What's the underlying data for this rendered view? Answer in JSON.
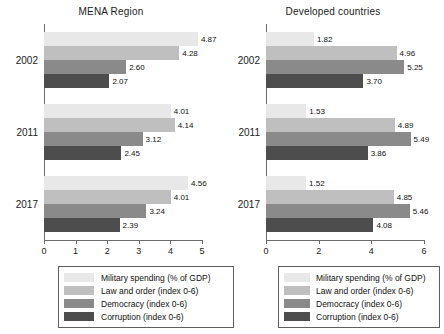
{
  "chart_data": {
    "type": "bar",
    "orientation": "horizontal",
    "title": "",
    "panels": [
      {
        "title": "MENA Region",
        "categories": [
          "2002",
          "2011",
          "2017"
        ],
        "xlabel": "",
        "ylabel": "",
        "xlim": [
          0,
          5
        ],
        "xticks": [
          "0",
          "1",
          "2",
          "3",
          "4",
          "5"
        ],
        "grid": false,
        "series": [
          {
            "name": "Military spending  (% of GDP)",
            "color": "#e8e8e8",
            "values": [
              4.87,
              4.01,
              4.56
            ]
          },
          {
            "name": "Law and order (index 0-6)",
            "color": "#bfbfbf",
            "values": [
              4.28,
              4.14,
              4.01
            ]
          },
          {
            "name": "Democracy (index 0-6)",
            "color": "#8a8a8a",
            "values": [
              2.6,
              3.12,
              3.24
            ]
          },
          {
            "name": "Corruption (index 0-6)",
            "color": "#4d4d4d",
            "values": [
              2.07,
              2.45,
              2.39
            ]
          }
        ],
        "data_labels": [
          [
            "4.87",
            "4.28",
            "2.60",
            "2.07"
          ],
          [
            "4.01",
            "4.14",
            "3.12",
            "2.45"
          ],
          [
            "4.56",
            "4.01",
            "3.24",
            "2.39"
          ]
        ]
      },
      {
        "title": "Developed countries",
        "categories": [
          "2002",
          "2011",
          "2017"
        ],
        "xlabel": "",
        "ylabel": "",
        "xlim": [
          0,
          6
        ],
        "xticks": [
          "0",
          "2",
          "4",
          "6"
        ],
        "grid": false,
        "series": [
          {
            "name": "Military spending  (% of GDP)",
            "color": "#e8e8e8",
            "values": [
              1.82,
              1.53,
              1.52
            ]
          },
          {
            "name": "Law and order (index 0-6)",
            "color": "#bfbfbf",
            "values": [
              4.96,
              4.89,
              4.85
            ]
          },
          {
            "name": "Democracy (index 0-6)",
            "color": "#8a8a8a",
            "values": [
              5.25,
              5.49,
              5.46
            ]
          },
          {
            "name": "Corruption (index 0-6)",
            "color": "#4d4d4d",
            "values": [
              3.7,
              3.86,
              4.08
            ]
          }
        ],
        "data_labels": [
          [
            "1.82",
            "4.96",
            "5.25",
            "3.70"
          ],
          [
            "1.53",
            "4.89",
            "5.49",
            "3.86"
          ],
          [
            "1.52",
            "4.85",
            "5.46",
            "4.08"
          ]
        ]
      }
    ],
    "legend_position": "bottom",
    "legends": [
      {
        "items": [
          {
            "label": "Military spending  (% of GDP)",
            "color": "#e8e8e8"
          },
          {
            "label": "Law and order (index 0-6)",
            "color": "#bfbfbf"
          },
          {
            "label": "Democracy (index 0-6)",
            "color": "#8a8a8a"
          },
          {
            "label": "Corruption (index 0-6)",
            "color": "#4d4d4d"
          }
        ]
      },
      {
        "items": [
          {
            "label": "Military spending  (% of GDP)",
            "color": "#e8e8e8"
          },
          {
            "label": "Law and order (index 0-6)",
            "color": "#bfbfbf"
          },
          {
            "label": "Democracy (index 0-6)",
            "color": "#8a8a8a"
          },
          {
            "label": "Corruption (index 0-6)",
            "color": "#4d4d4d"
          }
        ]
      }
    ]
  }
}
